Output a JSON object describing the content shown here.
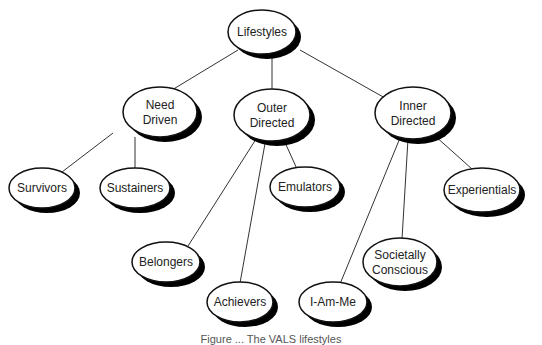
{
  "diagram": {
    "type": "tree",
    "root": "Lifestyles",
    "nodes": [
      {
        "id": "lifestyles",
        "lines": [
          "Lifestyles"
        ],
        "cx": 262,
        "cy": 32,
        "rx": 34,
        "ry": 22
      },
      {
        "id": "need-driven",
        "lines": [
          "Need",
          "Driven"
        ],
        "cx": 160,
        "cy": 112,
        "rx": 37,
        "ry": 25
      },
      {
        "id": "outer-directed",
        "lines": [
          "Outer",
          "Directed"
        ],
        "cx": 272,
        "cy": 115,
        "rx": 38,
        "ry": 26
      },
      {
        "id": "inner-directed",
        "lines": [
          "Inner",
          "Directed"
        ],
        "cx": 413,
        "cy": 113,
        "rx": 38,
        "ry": 26
      },
      {
        "id": "survivors",
        "lines": [
          "Survivors"
        ],
        "cx": 42,
        "cy": 188,
        "rx": 33,
        "ry": 20
      },
      {
        "id": "sustainers",
        "lines": [
          "Sustainers"
        ],
        "cx": 135,
        "cy": 188,
        "rx": 35,
        "ry": 20
      },
      {
        "id": "emulators",
        "lines": [
          "Emulators"
        ],
        "cx": 305,
        "cy": 187,
        "rx": 35,
        "ry": 20
      },
      {
        "id": "experientials",
        "lines": [
          "Experientials"
        ],
        "cx": 482,
        "cy": 190,
        "rx": 38,
        "ry": 22
      },
      {
        "id": "belongers",
        "lines": [
          "Belongers"
        ],
        "cx": 166,
        "cy": 262,
        "rx": 34,
        "ry": 20
      },
      {
        "id": "societally-conscious",
        "lines": [
          "Societally",
          "Conscious"
        ],
        "cx": 400,
        "cy": 262,
        "rx": 37,
        "ry": 24
      },
      {
        "id": "achievers",
        "lines": [
          "Achievers"
        ],
        "cx": 240,
        "cy": 302,
        "rx": 33,
        "ry": 20
      },
      {
        "id": "i-am-me",
        "lines": [
          "I-Am-Me"
        ],
        "cx": 333,
        "cy": 302,
        "rx": 34,
        "ry": 20
      }
    ],
    "edges": [
      {
        "from": "lifestyles",
        "to": "need-driven",
        "x1": 238,
        "y1": 50,
        "x2": 162,
        "y2": 96
      },
      {
        "from": "lifestyles",
        "to": "outer-directed",
        "x1": 272,
        "y1": 54,
        "x2": 272,
        "y2": 90
      },
      {
        "from": "lifestyles",
        "to": "inner-directed",
        "x1": 300,
        "y1": 50,
        "x2": 385,
        "y2": 98
      },
      {
        "from": "need-driven",
        "to": "survivors",
        "x1": 113,
        "y1": 133,
        "x2": 62,
        "y2": 172
      },
      {
        "from": "need-driven",
        "to": "sustainers",
        "x1": 135,
        "y1": 137,
        "x2": 135,
        "y2": 170
      },
      {
        "from": "outer-directed",
        "to": "belongers",
        "x1": 258,
        "y1": 136,
        "x2": 188,
        "y2": 246
      },
      {
        "from": "outer-directed",
        "to": "achievers",
        "x1": 266,
        "y1": 138,
        "x2": 240,
        "y2": 283
      },
      {
        "from": "outer-directed",
        "to": "emulators",
        "x1": 283,
        "y1": 138,
        "x2": 297,
        "y2": 169
      },
      {
        "from": "inner-directed",
        "to": "i-am-me",
        "x1": 400,
        "y1": 138,
        "x2": 340,
        "y2": 284
      },
      {
        "from": "inner-directed",
        "to": "societally-conscious",
        "x1": 408,
        "y1": 139,
        "x2": 402,
        "y2": 239
      },
      {
        "from": "inner-directed",
        "to": "experientials",
        "x1": 434,
        "y1": 135,
        "x2": 472,
        "y2": 169
      }
    ],
    "colors": {
      "line": "#333333",
      "fill": "#ffffff",
      "stroke": "#111111",
      "shadow": "#000000",
      "text": "#222222"
    }
  },
  "caption": "Figure ... The VALS lifestyles"
}
